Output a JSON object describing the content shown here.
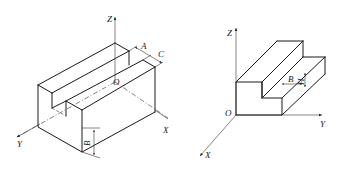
{
  "figures": [
    {
      "id": "left",
      "description": "Isometric block with longitudinal slot, axes at center of top slot",
      "axes": {
        "z": "Z",
        "y": "Y",
        "x": "X",
        "origin": "O"
      },
      "dimensions": {
        "slot_width": "A",
        "rib_width": "C",
        "height": "B"
      }
    },
    {
      "id": "right",
      "description": "Stepped block with axes at corner",
      "axes": {
        "z": "Z",
        "y": "Y",
        "x": "X",
        "origin": "O"
      },
      "dimensions": {
        "step_width": "B",
        "step_height": "H"
      }
    }
  ],
  "colors": {
    "line": "#1a1a1a",
    "background": "#ffffff"
  }
}
